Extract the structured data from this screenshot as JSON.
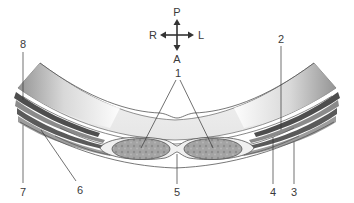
{
  "compass": {
    "top": "P",
    "bottom": "A",
    "left": "R",
    "right": "L"
  },
  "labels": [
    {
      "id": "1",
      "text": "1"
    },
    {
      "id": "2",
      "text": "2"
    },
    {
      "id": "3",
      "text": "3"
    },
    {
      "id": "4",
      "text": "4"
    },
    {
      "id": "5",
      "text": "5"
    },
    {
      "id": "6",
      "text": "6"
    },
    {
      "id": "7",
      "text": "7"
    },
    {
      "id": "8",
      "text": "8"
    }
  ],
  "colors": {
    "outline": "#555555",
    "band_dark": "#6e6e6e",
    "band_mid": "#a8a8a8",
    "band_light": "#e4e4e4",
    "muscle_fill": "#9a9a9a",
    "label_text": "#3a3a3a"
  }
}
